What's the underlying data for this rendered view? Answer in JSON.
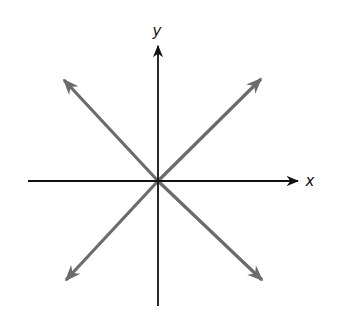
{
  "diagram": {
    "type": "coordinate-axes-with-diagonal-vectors",
    "origin": {
      "x": 158,
      "y": 181
    },
    "axes": {
      "x": {
        "label": "x",
        "color": "#111111",
        "from": [
          28,
          181
        ],
        "to": [
          298,
          181
        ],
        "label_pos": [
          310,
          186
        ]
      },
      "y": {
        "label": "y",
        "color": "#111111",
        "from": [
          158,
          306
        ],
        "to": [
          158,
          46
        ],
        "label_pos": [
          157,
          36
        ]
      }
    },
    "vectors": [
      {
        "name": "upper-left",
        "color": "#6b6b6b",
        "from": [
          158,
          181
        ],
        "to": [
          64,
          80
        ]
      },
      {
        "name": "upper-right",
        "color": "#6b6b6b",
        "from": [
          158,
          181
        ],
        "to": [
          261,
          79
        ]
      },
      {
        "name": "lower-left",
        "color": "#6b6b6b",
        "from": [
          158,
          181
        ],
        "to": [
          66,
          280
        ]
      },
      {
        "name": "lower-right",
        "color": "#6b6b6b",
        "from": [
          158,
          181
        ],
        "to": [
          262,
          280
        ]
      }
    ]
  }
}
